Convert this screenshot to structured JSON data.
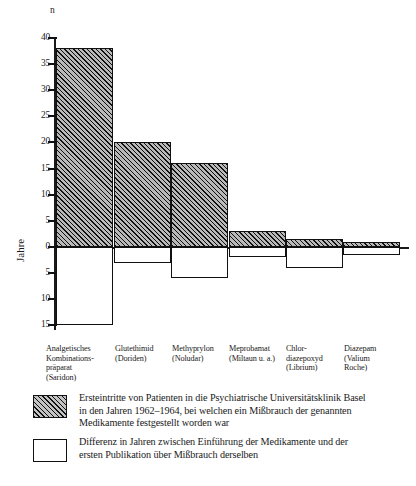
{
  "chart_data": {
    "type": "bar",
    "title": "",
    "subtitle": "",
    "ylabel_top": "n",
    "ylabel_bottom": "Jahre",
    "xlabel": "",
    "grid": false,
    "legend_position": "bottom",
    "ylim": [
      -15,
      40
    ],
    "yticks_positive": [
      0,
      5,
      10,
      15,
      20,
      25,
      30,
      35,
      40
    ],
    "yticks_negative": [
      5,
      10,
      15
    ],
    "ytick_labels_positive": [
      "0",
      "5",
      "10",
      "15",
      "20",
      "25",
      "30",
      "35",
      "40"
    ],
    "ytick_labels_negative": [
      "5",
      "10",
      "15"
    ],
    "categories": [
      "Analgetisches Kombinationspräparat (Saridon)",
      "Glutethimid (Doriden)",
      "Methyprylon (Noludar)",
      "Meprobamat (Miltaun u. a.)",
      "Chlordiazepoxyd (Librium)",
      "Diazepam (Valium Roche)"
    ],
    "series": [
      {
        "name": "Ersteintritte von Patienten in die Psychiatrische Universitätsklinik Basel in den Jahren 1962–1964, bei welchen ein Mißbrauch der genannten Medikamente festgestellt worden war",
        "unit": "n",
        "values": [
          38,
          20,
          16,
          3,
          1.5,
          1
        ]
      },
      {
        "name": "Differenz in Jahren zwischen Einführung der Medikamente und der ersten Publikation über Mißbrauch derselben",
        "unit": "Jahre",
        "values": [
          -15,
          -3,
          -6,
          -2,
          -4,
          -1.5
        ]
      }
    ]
  },
  "axis": {
    "top_unit": "n",
    "bottom_unit": "Jahre"
  },
  "categories_lines": [
    [
      "Analgetisches",
      "Kombinations-",
      "präparat",
      "(Saridon)"
    ],
    [
      "Glutethimid",
      "(Doriden)"
    ],
    [
      "Methyprylon",
      "(Noludar)"
    ],
    [
      "Meprobamat",
      "(Miltaun u. a.)"
    ],
    [
      "Chlor-",
      "diazepoxyd",
      "(Librium)"
    ],
    [
      "Diazepam",
      "(Valium",
      "Roche)"
    ]
  ],
  "legend": [
    {
      "swatch": "hatched",
      "lines": [
        "Ersteintritte von Patienten in die Psychiatrische Universitätsklinik Basel",
        "in den Jahren 1962–1964, bei welchen ein Mißbrauch der genannten",
        "Medikamente festgestellt worden war"
      ]
    },
    {
      "swatch": "empty",
      "lines": [
        "Differenz in Jahren zwischen Einführung der Medikamente und der",
        "ersten Publikation über Mißbrauch derselben"
      ]
    }
  ],
  "colors": {
    "ink": "#111111",
    "hatch_fill": "#b9b9b9",
    "background": "#ffffff"
  }
}
